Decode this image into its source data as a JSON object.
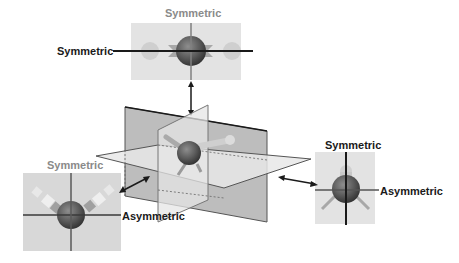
{
  "diagram": {
    "colors": {
      "panel_bg": "#d9d9d9",
      "panel_bg_light": "#e6e6e6",
      "plane_dark": "#bdbdbd",
      "plane_light": "#e2e2e2",
      "atom": "#5a5a5a",
      "axis_dark": "#1a1a1a",
      "label_gray": "#8a8a8a",
      "label_dark": "#1a1a1a"
    },
    "panels": {
      "top": {
        "title": "Symmetric",
        "side_label": "Symmetric"
      },
      "left": {
        "title": "Symmetric",
        "side_label": "Asymmetric"
      },
      "right": {
        "title": "Symmetric",
        "side_label": "Asymmetric"
      }
    }
  }
}
